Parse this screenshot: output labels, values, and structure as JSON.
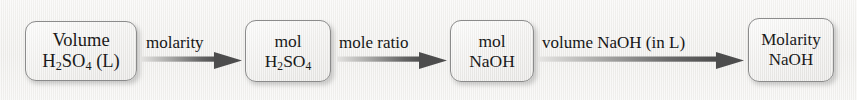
{
  "diagram": {
    "background_color": "#f2f1ef",
    "box_border_color": "#8b8b8b",
    "arrow_color_dark": "#4a4a4a",
    "arrow_color_light": "#d8d8d6",
    "text_color": "#1a1a1a"
  },
  "nodes": [
    {
      "id": "volume-h2so4",
      "line1": "Volume",
      "line2_prefix": "H",
      "line2_sub1": "2",
      "line2_mid": "SO",
      "line2_sub2": "4",
      "line2_suffix": " (L)",
      "plain": "Volume H2SO4 (L)"
    },
    {
      "id": "mol-h2so4",
      "line1": "mol",
      "line2_prefix": "H",
      "line2_sub1": "2",
      "line2_mid": "SO",
      "line2_sub2": "4",
      "line2_suffix": "",
      "plain": "mol H2SO4"
    },
    {
      "id": "mol-naoh",
      "line1": "mol",
      "line2_plain": "NaOH",
      "plain": "mol NaOH"
    },
    {
      "id": "molarity-naoh",
      "line1": "Molarity",
      "line2_plain": "NaOH",
      "plain": "Molarity NaOH"
    }
  ],
  "arrows": [
    {
      "id": "molarity",
      "label": "molarity"
    },
    {
      "id": "mole-ratio",
      "label": "mole ratio"
    },
    {
      "id": "volume-naoh",
      "label": "volume NaOH (in L)"
    }
  ]
}
